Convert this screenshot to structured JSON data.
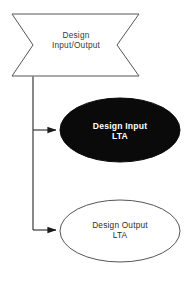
{
  "diagram": {
    "background_color": "#ffffff",
    "stroke_color": "#555555",
    "fill_black": "#000000",
    "text_color_dark": "#3a3a3a",
    "text_color_light": "#ffffff",
    "nodes": [
      {
        "id": "design-io",
        "shape": "double-arrow-banner",
        "label": "Design\nInput/Output",
        "fill": "#ffffff",
        "stroke": "#555555",
        "text_color": "#3a3a3a"
      },
      {
        "id": "design-input-lta",
        "shape": "ellipse",
        "label": "Design Input\nLTA",
        "fill": "#000000",
        "stroke": "#000000",
        "text_color": "#ffffff"
      },
      {
        "id": "design-output-lta",
        "shape": "ellipse",
        "label": "Design Output\nLTA",
        "fill": "#ffffff",
        "stroke": "#555555",
        "text_color": "#2e2e2e"
      }
    ],
    "connectors": [
      {
        "id": "connector-io-to-input",
        "from": "design-io",
        "to": "design-input-lta",
        "arrowhead": "solid-triangle"
      },
      {
        "id": "connector-io-to-output",
        "from": "design-io",
        "to": "design-output-lta",
        "arrowhead": "solid-triangle"
      }
    ]
  }
}
